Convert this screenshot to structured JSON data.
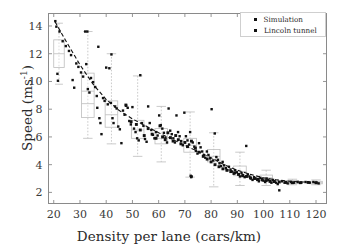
{
  "chart_data": {
    "type": "scatter",
    "title": "",
    "xlabel": "Density per lane (cars/km)",
    "ylabel": "Speed (ms",
    "ylabel_exponent": "-1",
    "ylabel_suffix": ")",
    "xlim": [
      18,
      124
    ],
    "ylim": [
      1.2,
      14.9
    ],
    "xticks": [
      20,
      30,
      40,
      50,
      60,
      70,
      80,
      90,
      100,
      110,
      120
    ],
    "yticks": [
      2,
      4,
      6,
      8,
      10,
      12,
      14
    ],
    "grid": false,
    "legend_position": "upper right",
    "marker_color": "#111111",
    "box_color": "#bdbdbd",
    "fitline_color": "#111111",
    "frame_color": "#8a8a8a",
    "series": [
      {
        "name": "Simulation",
        "marker": "square-small",
        "points": [
          [
            20.6,
            14.35
          ],
          [
            21.0,
            13.95
          ],
          [
            21.4,
            10.55
          ],
          [
            21.6,
            10.05
          ],
          [
            22.2,
            13.6
          ],
          [
            23.4,
            12.9
          ],
          [
            24.6,
            12.55
          ],
          [
            25.8,
            12.2
          ],
          [
            26.6,
            11.9
          ],
          [
            27.2,
            10.1
          ],
          [
            27.8,
            9.55
          ],
          [
            28.6,
            11.3
          ],
          [
            29.4,
            11.05
          ],
          [
            30.4,
            10.65
          ],
          [
            31.2,
            10.35
          ],
          [
            32.0,
            13.6
          ],
          [
            32.8,
            13.6
          ],
          [
            32.4,
            11.25
          ],
          [
            33.0,
            9.45
          ],
          [
            33.6,
            9.2
          ],
          [
            34.2,
            10.25
          ],
          [
            35.0,
            9.95
          ],
          [
            35.8,
            9.6
          ],
          [
            36.4,
            8.95
          ],
          [
            36.6,
            8.1
          ],
          [
            37.0,
            12.5
          ],
          [
            37.4,
            7.35
          ],
          [
            37.8,
            7.0
          ],
          [
            38.2,
            6.2
          ],
          [
            38.8,
            8.8
          ],
          [
            39.4,
            8.6
          ],
          [
            40.0,
            11.0
          ],
          [
            40.6,
            8.35
          ],
          [
            41.2,
            10.95
          ],
          [
            41.8,
            8.45
          ],
          [
            42.0,
            11.95
          ],
          [
            42.4,
            7.35
          ],
          [
            42.8,
            7.0
          ],
          [
            43.4,
            8.2
          ],
          [
            44.0,
            8.05
          ],
          [
            44.6,
            6.75
          ],
          [
            45.2,
            6.55
          ],
          [
            45.8,
            5.55
          ],
          [
            46.4,
            7.9
          ],
          [
            47.0,
            7.6
          ],
          [
            47.6,
            8.25
          ],
          [
            48.2,
            8.1
          ],
          [
            48.8,
            7.15
          ],
          [
            49.4,
            6.9
          ],
          [
            50.0,
            8.15
          ],
          [
            50.6,
            6.6
          ],
          [
            51.2,
            6.35
          ],
          [
            51.8,
            5.9
          ],
          [
            52.4,
            5.75
          ],
          [
            53.0,
            10.45
          ],
          [
            53.6,
            7.0
          ],
          [
            54.2,
            6.8
          ],
          [
            54.8,
            5.85
          ],
          [
            55.4,
            5.65
          ],
          [
            56.0,
            8.2
          ],
          [
            56.6,
            7.0
          ],
          [
            57.2,
            6.5
          ],
          [
            57.8,
            6.15
          ],
          [
            58.4,
            5.9
          ],
          [
            59.0,
            6.35
          ],
          [
            59.6,
            6.1
          ],
          [
            60.2,
            7.55
          ],
          [
            60.8,
            6.85
          ],
          [
            61.4,
            6.6
          ],
          [
            62.0,
            6.3
          ],
          [
            62.6,
            5.95
          ],
          [
            63.2,
            5.6
          ],
          [
            63.8,
            8.05
          ],
          [
            64.4,
            6.45
          ],
          [
            65.0,
            6.2
          ],
          [
            65.6,
            5.9
          ],
          [
            66.2,
            5.6
          ],
          [
            66.8,
            7.55
          ],
          [
            67.4,
            6.35
          ],
          [
            68.0,
            6.05
          ],
          [
            68.6,
            5.7
          ],
          [
            69.2,
            5.4
          ],
          [
            69.8,
            7.75
          ],
          [
            70.4,
            6.05
          ],
          [
            71.0,
            5.75
          ],
          [
            71.6,
            5.45
          ],
          [
            72.0,
            6.35
          ],
          [
            72.2,
            3.2
          ],
          [
            72.4,
            3.1
          ],
          [
            72.6,
            3.15
          ],
          [
            73.0,
            5.6
          ],
          [
            73.6,
            5.3
          ],
          [
            74.2,
            5.0
          ],
          [
            74.8,
            4.8
          ],
          [
            75.4,
            5.55
          ],
          [
            76.0,
            5.25
          ],
          [
            76.6,
            4.95
          ],
          [
            77.2,
            4.7
          ],
          [
            77.8,
            4.5
          ],
          [
            78.4,
            4.95
          ],
          [
            79.0,
            4.7
          ],
          [
            79.6,
            4.45
          ],
          [
            80.2,
            8.0
          ],
          [
            80.8,
            4.3
          ],
          [
            81.4,
            6.25
          ],
          [
            82.0,
            4.55
          ],
          [
            82.6,
            4.35
          ],
          [
            83.2,
            4.1
          ],
          [
            83.8,
            3.9
          ],
          [
            84.4,
            4.2
          ],
          [
            85.0,
            3.95
          ],
          [
            85.6,
            3.75
          ],
          [
            86.2,
            3.6
          ],
          [
            86.8,
            3.85
          ],
          [
            87.4,
            3.65
          ],
          [
            88.0,
            3.5
          ],
          [
            88.6,
            3.35
          ],
          [
            89.2,
            3.6
          ],
          [
            89.8,
            3.45
          ],
          [
            90.4,
            3.3
          ],
          [
            91.0,
            3.15
          ],
          [
            91.6,
            3.4
          ],
          [
            92.2,
            3.25
          ],
          [
            92.8,
            3.1
          ],
          [
            93.4,
            5.35
          ],
          [
            94.0,
            3.3
          ],
          [
            94.6,
            3.15
          ],
          [
            95.2,
            3.0
          ],
          [
            95.8,
            2.9
          ],
          [
            96.4,
            3.1
          ],
          [
            97.0,
            3.0
          ],
          [
            97.6,
            2.9
          ],
          [
            98.2,
            2.8
          ],
          [
            98.8,
            3.05
          ],
          [
            99.4,
            2.95
          ],
          [
            100.0,
            2.85
          ],
          [
            100.6,
            2.75
          ],
          [
            101.2,
            3.0
          ],
          [
            101.8,
            2.9
          ],
          [
            102.4,
            2.8
          ],
          [
            103.0,
            2.7
          ],
          [
            103.6,
            2.9
          ],
          [
            104.2,
            2.8
          ],
          [
            104.8,
            2.7
          ],
          [
            105.4,
            2.6
          ],
          [
            106.0,
            2.15
          ],
          [
            107.0,
            2.8
          ],
          [
            108.0,
            2.7
          ],
          [
            109.2,
            2.65
          ],
          [
            110.4,
            2.75
          ],
          [
            111.6,
            2.7
          ],
          [
            113.0,
            2.75
          ],
          [
            114.4,
            2.7
          ],
          [
            116.0,
            2.75
          ],
          [
            117.6,
            2.7
          ],
          [
            119.0,
            2.75
          ],
          [
            120.2,
            2.7
          ],
          [
            121.0,
            2.65
          ]
        ]
      },
      {
        "name": "Lincoln tunnel",
        "marker": "square-large",
        "points": [
          [
            47.5,
            8.3
          ],
          [
            49.5,
            7.1
          ],
          [
            51.5,
            6.9
          ],
          [
            53.0,
            6.5
          ],
          [
            54.5,
            6.1
          ],
          [
            56.0,
            6.6
          ],
          [
            57.5,
            6.2
          ],
          [
            59.0,
            5.9
          ],
          [
            60.5,
            6.8
          ],
          [
            61.5,
            6.0
          ],
          [
            62.5,
            5.8
          ],
          [
            63.5,
            6.3
          ],
          [
            64.5,
            5.95
          ],
          [
            65.5,
            5.7
          ],
          [
            66.5,
            6.1
          ],
          [
            67.5,
            5.8
          ],
          [
            68.5,
            5.5
          ],
          [
            70.0,
            5.6
          ],
          [
            71.0,
            5.3
          ],
          [
            72.5,
            5.7
          ],
          [
            74.0,
            5.2
          ],
          [
            75.5,
            4.9
          ],
          [
            77.0,
            4.6
          ],
          [
            78.5,
            4.4
          ],
          [
            80.0,
            4.2
          ],
          [
            81.5,
            4.0
          ],
          [
            83.0,
            3.85
          ],
          [
            84.5,
            3.7
          ],
          [
            86.0,
            3.6
          ],
          [
            87.5,
            3.5
          ],
          [
            89.0,
            3.4
          ],
          [
            90.5,
            3.3
          ],
          [
            92.0,
            3.2
          ],
          [
            93.5,
            3.15
          ],
          [
            95.0,
            3.05
          ],
          [
            96.5,
            3.0
          ],
          [
            98.0,
            2.95
          ],
          [
            99.5,
            2.9
          ],
          [
            101.0,
            2.85
          ],
          [
            102.5,
            2.8
          ],
          [
            104.0,
            2.78
          ],
          [
            106.0,
            2.75
          ],
          [
            108.5,
            2.72
          ],
          [
            111.0,
            2.7
          ],
          [
            114.0,
            2.7
          ],
          [
            117.0,
            2.72
          ],
          [
            120.0,
            2.7
          ]
        ]
      }
    ],
    "fit_line": {
      "style": "dashed",
      "points": [
        [
          20.5,
          14.3
        ],
        [
          25,
          12.8
        ],
        [
          30,
          11.2
        ],
        [
          35,
          9.8
        ],
        [
          40,
          8.7
        ],
        [
          45,
          7.9
        ],
        [
          50,
          7.3
        ],
        [
          55,
          6.8
        ],
        [
          60,
          6.3
        ],
        [
          65,
          5.85
        ],
        [
          70,
          5.4
        ],
        [
          75,
          4.95
        ],
        [
          80,
          4.5
        ],
        [
          85,
          4.0
        ],
        [
          90,
          3.6
        ],
        [
          95,
          3.3
        ],
        [
          100,
          3.05
        ],
        [
          105,
          2.9
        ],
        [
          110,
          2.8
        ],
        [
          115,
          2.75
        ],
        [
          121,
          2.7
        ]
      ]
    },
    "boxplots": [
      {
        "x": 22,
        "q1": 11.0,
        "median": 12.0,
        "q3": 13.0,
        "low": 9.8,
        "high": 14.2,
        "width": 2.0
      },
      {
        "x": 33,
        "q1": 7.4,
        "median": 9.3,
        "median2": 8.4,
        "q3": 10.6,
        "low": 5.9,
        "high": 13.6,
        "width": 2.4
      },
      {
        "x": 42,
        "q1": 6.7,
        "median": 7.6,
        "q3": 8.6,
        "low": 5.5,
        "high": 12.0,
        "width": 2.4
      },
      {
        "x": 52,
        "q1": 5.9,
        "median": 6.5,
        "q3": 7.2,
        "low": 4.6,
        "high": 10.4,
        "width": 2.4
      },
      {
        "x": 61,
        "q1": 5.5,
        "median": 5.9,
        "q3": 6.6,
        "low": 4.2,
        "high": 8.2,
        "width": 2.4
      },
      {
        "x": 72,
        "q1": 4.9,
        "median": 5.4,
        "q3": 5.9,
        "low": 3.1,
        "high": 7.8,
        "width": 2.4
      },
      {
        "x": 81,
        "q1": 4.2,
        "median": 4.6,
        "q3": 5.1,
        "low": 2.4,
        "high": 6.3,
        "width": 2.4
      },
      {
        "x": 91,
        "q1": 3.2,
        "median": 3.5,
        "q3": 3.9,
        "low": 2.5,
        "high": 4.9,
        "width": 2.4
      },
      {
        "x": 101,
        "q1": 2.85,
        "median": 3.05,
        "q3": 3.25,
        "low": 2.5,
        "high": 3.6,
        "width": 2.4
      },
      {
        "x": 111,
        "q1": 2.65,
        "median": 2.75,
        "q3": 2.85,
        "low": 2.55,
        "high": 2.95,
        "width": 2.4
      },
      {
        "x": 120,
        "q1": 2.62,
        "median": 2.7,
        "q3": 2.8,
        "low": 2.55,
        "high": 2.9,
        "width": 2.4
      }
    ]
  },
  "legend": {
    "entries": [
      {
        "label": "Simulation",
        "marker": "square-small"
      },
      {
        "label": "Lincoln tunnel",
        "marker": "square-large"
      }
    ]
  },
  "axes": {
    "xlabel": "Density per lane (cars/km)",
    "ylabel_main": "Speed (ms",
    "ylabel_exp": "-1",
    "ylabel_close": ")",
    "xtick_labels": [
      "20",
      "30",
      "40",
      "50",
      "60",
      "70",
      "80",
      "90",
      "100",
      "110",
      "120"
    ],
    "ytick_labels": [
      "2",
      "4",
      "6",
      "8",
      "10",
      "12",
      "14"
    ]
  }
}
